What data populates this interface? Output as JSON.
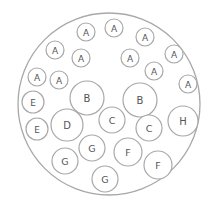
{
  "diagram": {
    "type": "circle-packing",
    "outer": {
      "cx": 109,
      "cy": 104,
      "r": 91
    },
    "colors": {
      "stroke": "#a8a8a8",
      "text": "#555555",
      "background": "#ffffff"
    },
    "nodes": [
      {
        "label": "A",
        "cx": 86,
        "cy": 32,
        "r": 9
      },
      {
        "label": "A",
        "cx": 114,
        "cy": 28,
        "r": 9
      },
      {
        "label": "A",
        "cx": 145,
        "cy": 37,
        "r": 9
      },
      {
        "label": "A",
        "cx": 55,
        "cy": 50,
        "r": 9
      },
      {
        "label": "A",
        "cx": 81,
        "cy": 58,
        "r": 9
      },
      {
        "label": "A",
        "cx": 130,
        "cy": 58,
        "r": 9
      },
      {
        "label": "A",
        "cx": 174,
        "cy": 54,
        "r": 9
      },
      {
        "label": "A",
        "cx": 154,
        "cy": 71,
        "r": 9
      },
      {
        "label": "A",
        "cx": 37,
        "cy": 77,
        "r": 9
      },
      {
        "label": "A",
        "cx": 59,
        "cy": 80,
        "r": 9
      },
      {
        "label": "A",
        "cx": 188,
        "cy": 84,
        "r": 9
      },
      {
        "label": "B",
        "cx": 87,
        "cy": 98,
        "r": 17
      },
      {
        "label": "B",
        "cx": 140,
        "cy": 100,
        "r": 17
      },
      {
        "label": "E",
        "cx": 33,
        "cy": 102,
        "r": 11
      },
      {
        "label": "E",
        "cx": 37,
        "cy": 129,
        "r": 11
      },
      {
        "label": "D",
        "cx": 67,
        "cy": 125,
        "r": 16
      },
      {
        "label": "C",
        "cx": 112,
        "cy": 120,
        "r": 13
      },
      {
        "label": "C",
        "cx": 149,
        "cy": 128,
        "r": 13
      },
      {
        "label": "H",
        "cx": 183,
        "cy": 121,
        "r": 15
      },
      {
        "label": "G",
        "cx": 92,
        "cy": 148,
        "r": 13
      },
      {
        "label": "G",
        "cx": 65,
        "cy": 161,
        "r": 13
      },
      {
        "label": "G",
        "cx": 105,
        "cy": 179,
        "r": 13
      },
      {
        "label": "F",
        "cx": 128,
        "cy": 152,
        "r": 14
      },
      {
        "label": "F",
        "cx": 158,
        "cy": 165,
        "r": 14
      }
    ]
  }
}
